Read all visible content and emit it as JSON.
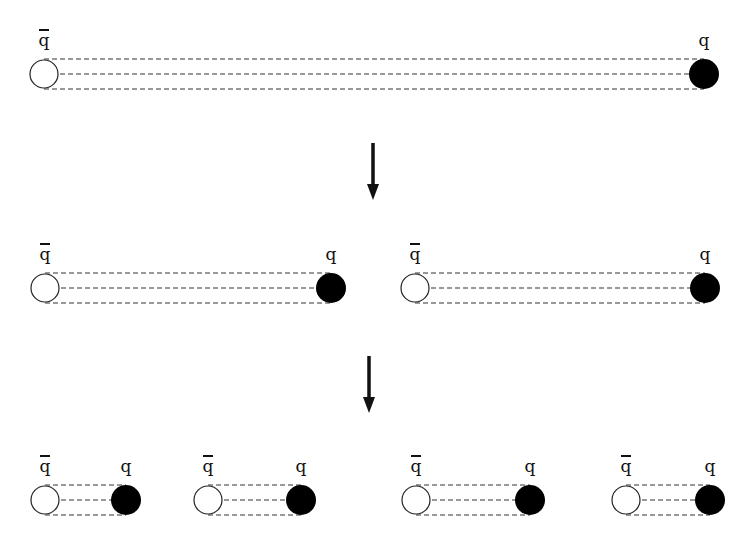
{
  "diagram": {
    "title": "",
    "labels": {
      "antiquark": "q",
      "quark": "q"
    },
    "colors": {
      "antiquark_fill": "#ffffff",
      "quark_fill": "#000000",
      "line": "#333333",
      "arrow": "#111111"
    },
    "stages": [
      {
        "name": "stage-1",
        "pairs": [
          {
            "antiquark_x": 44,
            "quark_x": 704,
            "y": 74,
            "radius": 15
          }
        ]
      },
      {
        "name": "stage-2",
        "pairs": [
          {
            "antiquark_x": 45,
            "quark_x": 331,
            "y": 288,
            "radius": 15
          },
          {
            "antiquark_x": 415,
            "quark_x": 705,
            "y": 288,
            "radius": 15
          }
        ]
      },
      {
        "name": "stage-3",
        "pairs": [
          {
            "antiquark_x": 45,
            "quark_x": 126,
            "y": 500,
            "radius": 15
          },
          {
            "antiquark_x": 208,
            "quark_x": 301,
            "y": 500,
            "radius": 15
          },
          {
            "antiquark_x": 416,
            "quark_x": 530,
            "y": 500,
            "radius": 15
          },
          {
            "antiquark_x": 626,
            "quark_x": 710,
            "y": 500,
            "radius": 15
          }
        ]
      }
    ],
    "arrows": [
      {
        "x": 373,
        "y1": 143,
        "y2": 200
      },
      {
        "x": 369,
        "y1": 356,
        "y2": 413
      }
    ]
  }
}
